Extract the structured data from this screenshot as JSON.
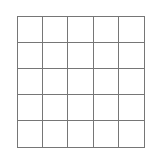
{
  "diagram": {
    "type": "grid",
    "rows": 5,
    "columns": 5,
    "line_color": "#767676",
    "cell_fill": "#ffffff",
    "background": "#ffffff"
  }
}
